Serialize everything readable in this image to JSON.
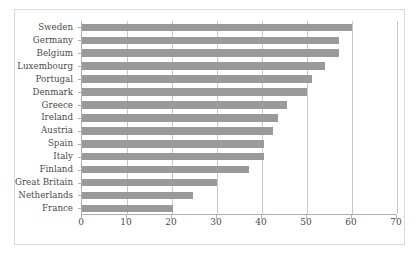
{
  "chart_data": {
    "type": "bar",
    "orientation": "horizontal",
    "title": "",
    "subtitle": "",
    "xlabel": "",
    "ylabel": "",
    "xlim": [
      0,
      70
    ],
    "ylim": null,
    "xticks": [
      0,
      10,
      20,
      30,
      40,
      50,
      60,
      70
    ],
    "grid": "vertical",
    "legend": null,
    "legend_position": "none",
    "bar_color": "#9a9a9a",
    "gridline_color": "#c9c9c9",
    "axis_color": "#b0b0b0",
    "frame_color": "#d8d8d8",
    "background": "#ffffff",
    "categories": [
      "Sweden",
      "Germany",
      "Belgium",
      "Luxembourg",
      "Portugal",
      "Denmark",
      "Greece",
      "Ireland",
      "Austria",
      "Spain",
      "Italy",
      "Finland",
      "Great Britain",
      "Netherlands",
      "France"
    ],
    "values": [
      60,
      57,
      57,
      54,
      51,
      50,
      45.5,
      43.5,
      42.5,
      40.5,
      40.5,
      37,
      30,
      24.7,
      20.3
    ]
  }
}
